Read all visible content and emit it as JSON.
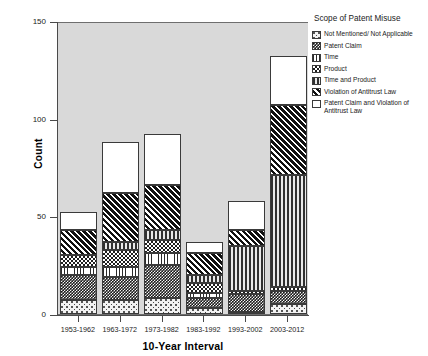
{
  "chart_data": {
    "type": "bar",
    "subtype": "stacked-bar",
    "title": "",
    "xlabel": "10-Year Interval",
    "ylabel": "Count",
    "ylim": [
      0,
      150
    ],
    "yticks": [
      0,
      50,
      100,
      150
    ],
    "ytick_labels": [
      "0",
      "50",
      "100",
      "150"
    ],
    "grid": false,
    "legend_position": "right",
    "legend_title": "Scope of Patent Misuse",
    "categories": [
      "1953-1962",
      "1963-1972",
      "1973-1982",
      "1983-1992",
      "1993-2002",
      "2003-2012"
    ],
    "series": [
      {
        "name": "Not Mentioned/ Not Applicable",
        "pattern": "light-stipple",
        "values": [
          7,
          7,
          8,
          3,
          1,
          5
        ]
      },
      {
        "name": "Patent Claim",
        "pattern": "dense-checkerboard",
        "values": [
          13,
          12,
          17,
          5,
          9,
          7
        ]
      },
      {
        "name": "Time",
        "pattern": "white-vertical-pinstripe",
        "values": [
          4,
          5,
          6,
          3,
          0,
          0
        ]
      },
      {
        "name": "Product",
        "pattern": "checkerboard",
        "values": [
          6,
          9,
          7,
          5,
          2,
          2
        ]
      },
      {
        "name": "Time and Product",
        "pattern": "vertical-bars",
        "values": [
          0,
          4,
          5,
          4,
          23,
          57
        ]
      },
      {
        "name": "Violation of Antitrust Law",
        "pattern": "diagonal-hatch",
        "values": [
          13,
          25,
          23,
          11,
          8,
          36
        ]
      },
      {
        "name": "Patent Claim and Violation of Antitrust Law",
        "pattern": "plain-white",
        "values": [
          9,
          26,
          26,
          6,
          15,
          25
        ]
      }
    ],
    "totals": [
      52,
      88,
      92,
      37,
      58,
      132
    ]
  },
  "axes": {
    "y": {
      "label": "Count",
      "ticks": [
        {
          "value": 150,
          "label": "150"
        },
        {
          "value": 100,
          "label": "100"
        },
        {
          "value": 50,
          "label": "50"
        },
        {
          "value": 0,
          "label": "0"
        }
      ]
    },
    "x": {
      "label": "10-Year Interval",
      "ticks": [
        {
          "label": "1953-1962"
        },
        {
          "label": "1963-1972"
        },
        {
          "label": "1973-1982"
        },
        {
          "label": "1983-1992"
        },
        {
          "label": "1993-2002"
        },
        {
          "label": "2003-2012"
        }
      ]
    }
  },
  "legend": {
    "title": "Scope of Patent Misuse",
    "items": [
      {
        "label": "Not Mentioned/ Not Applicable",
        "pattern": "light-stipple"
      },
      {
        "label": "Patent Claim",
        "pattern": "dense-checkerboard"
      },
      {
        "label": "Time",
        "pattern": "white-vertical-pinstripe"
      },
      {
        "label": "Product",
        "pattern": "checkerboard"
      },
      {
        "label": "Time and Product",
        "pattern": "vertical-bars"
      },
      {
        "label": "Violation of Antitrust Law",
        "pattern": "diagonal-hatch"
      },
      {
        "label": "Patent Claim and Violation of Antitrust Law",
        "pattern": "plain-white"
      }
    ]
  },
  "colors": {
    "plot_background": "#d9d9d9",
    "page_background": "#ffffff",
    "axis": "#4a4a4a",
    "bar_outline": "#3a3a3a",
    "text": "#1a1a1a"
  }
}
